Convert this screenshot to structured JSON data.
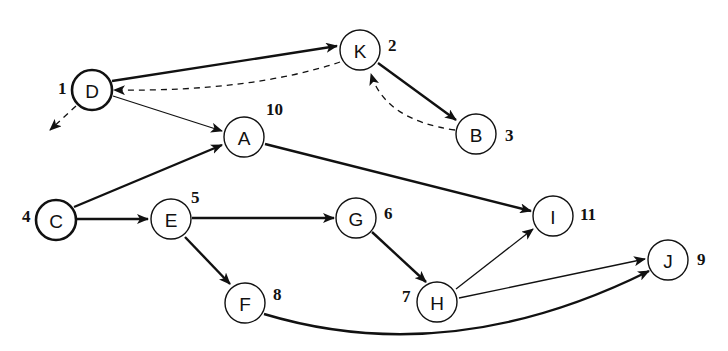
{
  "diagram": {
    "type": "directed-graph",
    "nodes": [
      {
        "id": "D",
        "label": "D",
        "order": "1",
        "x": 92,
        "y": 90,
        "start": true
      },
      {
        "id": "K",
        "label": "K",
        "order": "2",
        "x": 360,
        "y": 50,
        "start": false
      },
      {
        "id": "B",
        "label": "B",
        "order": "3",
        "x": 476,
        "y": 134,
        "start": false
      },
      {
        "id": "C",
        "label": "C",
        "order": "4",
        "x": 56,
        "y": 220,
        "start": true
      },
      {
        "id": "E",
        "label": "E",
        "order": "5",
        "x": 171,
        "y": 220,
        "start": false
      },
      {
        "id": "G",
        "label": "G",
        "order": "6",
        "x": 356,
        "y": 218,
        "start": false
      },
      {
        "id": "H",
        "label": "H",
        "order": "7",
        "x": 437,
        "y": 302,
        "start": false
      },
      {
        "id": "F",
        "label": "F",
        "order": "8",
        "x": 245,
        "y": 302,
        "start": false
      },
      {
        "id": "J",
        "label": "J",
        "order": "9",
        "x": 668,
        "y": 260,
        "start": false
      },
      {
        "id": "A",
        "label": "A",
        "order": "10",
        "x": 244,
        "y": 138,
        "start": false
      },
      {
        "id": "I",
        "label": "I",
        "order": "11",
        "x": 553,
        "y": 216,
        "start": false
      }
    ],
    "edges": [
      {
        "from": "D",
        "to": "K",
        "style": "thick"
      },
      {
        "from": "K",
        "to": "B",
        "style": "thick"
      },
      {
        "from": "B",
        "to": "K",
        "style": "dashed"
      },
      {
        "from": "K",
        "to": "D",
        "style": "dashed"
      },
      {
        "from": "D",
        "to": "A",
        "style": "thin"
      },
      {
        "from": "D",
        "to": "(off-graph)",
        "style": "dashed"
      },
      {
        "from": "C",
        "to": "A",
        "style": "thick"
      },
      {
        "from": "C",
        "to": "E",
        "style": "thick"
      },
      {
        "from": "A",
        "to": "I",
        "style": "thick"
      },
      {
        "from": "E",
        "to": "G",
        "style": "thick"
      },
      {
        "from": "E",
        "to": "F",
        "style": "thick"
      },
      {
        "from": "G",
        "to": "H",
        "style": "thick"
      },
      {
        "from": "H",
        "to": "I",
        "style": "thin"
      },
      {
        "from": "H",
        "to": "J",
        "style": "thin"
      },
      {
        "from": "F",
        "to": "J",
        "style": "thick"
      }
    ]
  }
}
